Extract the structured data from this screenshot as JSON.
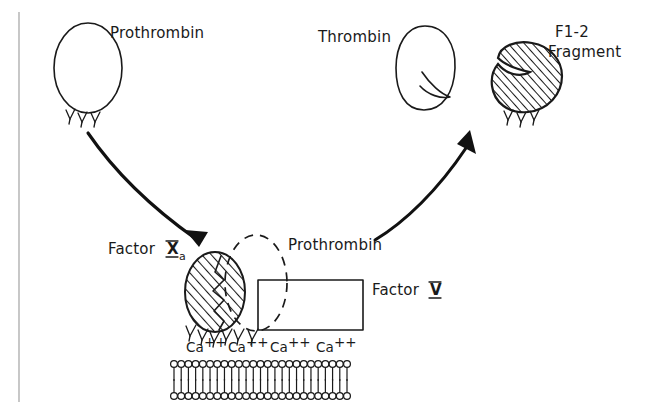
{
  "figure": {
    "background_color": "#ffffff",
    "ink_color": "#1a1a1a",
    "rule_color": "#9a9a9a"
  },
  "labels": {
    "prothrombin_top": "Prothrombin",
    "thrombin": "Thrombin",
    "fragment_line1": "F1-2",
    "fragment_line2": "Fragment",
    "factor_xa_word": "Factor",
    "factor_xa_numeral": "X",
    "factor_xa_subscript": "a",
    "prothrombin_center": "Prothrombin",
    "factor_v_word": "Factor",
    "factor_v_numeral": "V"
  },
  "calcium_ions": [
    {
      "symbol": "Ca",
      "charge": "++",
      "x": 186
    },
    {
      "symbol": "Ca",
      "charge": "++",
      "x": 228
    },
    {
      "symbol": "Ca",
      "charge": "++",
      "x": 270
    },
    {
      "symbol": "Ca",
      "charge": "++",
      "x": 316
    }
  ],
  "shapes": {
    "prothrombin_oval": {
      "name": "prothrombin-oval",
      "cx": 88,
      "cy": 68,
      "rx": 34,
      "ry": 45,
      "fill": "none",
      "prongs": 3
    },
    "thrombin_oval": {
      "name": "thrombin-oval",
      "cx": 425,
      "cy": 68,
      "rx": 28,
      "ry": 42,
      "fill": "none",
      "notch": true
    },
    "f12_fragment": {
      "name": "f1-2-fragment",
      "cx": 527,
      "cy": 80,
      "fill": "hatched",
      "prongs": 3
    },
    "factor_xa_ellipse": {
      "name": "factor-xa-ellipse",
      "cx": 215,
      "cy": 292,
      "rx": 30,
      "ry": 40,
      "fill": "hatched",
      "prongs": 5
    },
    "prothrombin_dashed_oval": {
      "name": "prothrombin-dashed-oval",
      "cx": 256,
      "cy": 283,
      "rx": 31,
      "ry": 48,
      "fill": "none",
      "stroke": "dashed"
    },
    "factor_v_rect": {
      "name": "factor-v-rectangle",
      "x": 258,
      "y": 280,
      "w": 105,
      "h": 50,
      "fill": "none"
    }
  },
  "membrane": {
    "name": "phospholipid-bilayer",
    "leaflets": 2,
    "lipids_per_leaflet": 25,
    "x_start": 174,
    "x_end": 347,
    "upper_head_y": 364,
    "lower_head_y": 396
  },
  "arrows": [
    {
      "name": "prothrombin-to-complex-arrow",
      "from": "prothrombin-oval",
      "to": "factor-xa-complex",
      "direction": "down-right"
    },
    {
      "name": "complex-to-products-arrow",
      "from": "prothrombin-complex",
      "to": "thrombin-and-fragment",
      "direction": "up-right"
    }
  ],
  "border_rule": {
    "name": "left-vertical-rule",
    "x": 19,
    "y_start": 12,
    "y_end": 402
  }
}
